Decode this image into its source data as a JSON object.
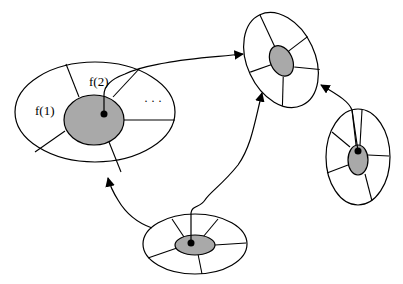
{
  "diagram": {
    "type": "node-link",
    "colors": {
      "stroke": "#000000",
      "core_fill": "#a9a9a9",
      "background": "#ffffff"
    },
    "nodes": [
      {
        "id": "large",
        "labels": [
          "f(1)",
          "f(2)",
          "..."
        ]
      },
      {
        "id": "top-right"
      },
      {
        "id": "right"
      },
      {
        "id": "bottom"
      }
    ],
    "edges": [
      {
        "from": "large",
        "to": "top-right"
      },
      {
        "from": "bottom",
        "to": "large"
      },
      {
        "from": "bottom",
        "to": "top-right"
      },
      {
        "from": "right",
        "to": "top-right"
      }
    ]
  },
  "labels": {
    "f1": "f(1)",
    "f2": "f(2)",
    "ellipsis": "· · ·"
  }
}
